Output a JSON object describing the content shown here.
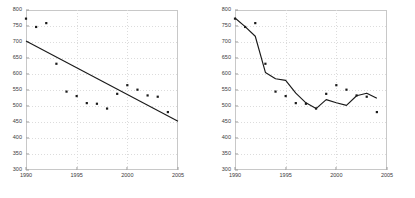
{
  "figure": {
    "background": "#ffffff",
    "marker_color": "#1a1a1a",
    "line_color": "#1a1a1a",
    "grid_color": "#dcdcdc",
    "frame_color": "#c8c8c8"
  },
  "chart_data": [
    {
      "type": "scatter",
      "title": "",
      "xlabel": "",
      "ylabel": "",
      "xlim": [
        1990,
        2005
      ],
      "ylim": [
        300,
        800
      ],
      "xticks": [
        1990,
        1995,
        2000,
        2005
      ],
      "yticks": [
        300,
        350,
        400,
        450,
        500,
        550,
        600,
        650,
        700,
        750,
        800
      ],
      "grid": true,
      "legend": "none",
      "series": [
        {
          "name": "observations",
          "kind": "scatter",
          "x": [
            1990,
            1991,
            1992,
            1993,
            1994,
            1995,
            1996,
            1997,
            1998,
            1999,
            2000,
            2001,
            2002,
            2003,
            2004
          ],
          "values": [
            773,
            747,
            759,
            632,
            545,
            531,
            509,
            507,
            492,
            538,
            565,
            551,
            533,
            529,
            481
          ]
        },
        {
          "name": "linear trend",
          "kind": "line",
          "x": [
            1990,
            2005
          ],
          "values": [
            703,
            452
          ]
        }
      ]
    },
    {
      "type": "scatter",
      "title": "",
      "xlabel": "",
      "ylabel": "",
      "xlim": [
        1990,
        2005
      ],
      "ylim": [
        300,
        800
      ],
      "xticks": [
        1990,
        1995,
        2000,
        2005
      ],
      "yticks": [
        300,
        350,
        400,
        450,
        500,
        550,
        600,
        650,
        700,
        750,
        800
      ],
      "grid": true,
      "legend": "none",
      "series": [
        {
          "name": "observations",
          "kind": "scatter",
          "x": [
            1990,
            1991,
            1992,
            1993,
            1994,
            1995,
            1996,
            1997,
            1998,
            1999,
            2000,
            2001,
            2002,
            2003,
            2004
          ],
          "values": [
            773,
            747,
            759,
            632,
            545,
            531,
            509,
            507,
            492,
            538,
            565,
            551,
            533,
            529,
            481
          ]
        },
        {
          "name": "fitted curve",
          "kind": "line",
          "x": [
            1990,
            1991,
            1992,
            1993,
            1994,
            1995,
            1996,
            1997,
            1998,
            1999,
            2000,
            2001,
            2002,
            2003,
            2004
          ],
          "values": [
            775,
            748,
            718,
            605,
            585,
            580,
            540,
            510,
            492,
            520,
            510,
            502,
            532,
            540,
            524
          ]
        }
      ]
    }
  ]
}
